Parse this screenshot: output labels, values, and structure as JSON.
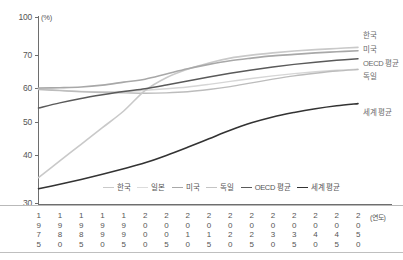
{
  "chart_data": {
    "type": "line",
    "title": "",
    "subtitle": "",
    "xlabel": "(연도)",
    "ylabel": "(%)",
    "unit": "(%)",
    "x": [
      1975,
      1980,
      1985,
      1990,
      1995,
      2000,
      2005,
      2010,
      2015,
      2020,
      2025,
      2030,
      2035,
      2040,
      2045,
      2050
    ],
    "xlim": [
      1975,
      2050
    ],
    "xtick_labels": [
      "1975",
      "1980",
      "1985",
      "1990",
      "1995",
      "2000",
      "2005",
      "2010",
      "2015",
      "2020",
      "2025",
      "2030",
      "2035",
      "2040",
      "2045",
      "2050"
    ],
    "ylim": [
      30,
      100
    ],
    "ytick_labels": [
      "30",
      "40",
      "50",
      "60",
      "70",
      "100"
    ],
    "ytick_values": [
      30,
      40,
      50,
      60,
      70,
      100
    ],
    "axis_break": true,
    "grid": false,
    "legend_position": "bottom-center",
    "series": [
      {
        "name": "한국",
        "color": "#c9c9c9",
        "width": 1.6,
        "end_label": "한국",
        "values": [
          37.0,
          41.5,
          46.0,
          50.5,
          55.0,
          60.5,
          64.0,
          66.3,
          68.0,
          69.3,
          70.1,
          70.7,
          71.2,
          71.6,
          71.9,
          72.2
        ]
      },
      {
        "name": "일본",
        "color": "#d6d6d6",
        "width": 1.4,
        "end_label": "",
        "values": [
          61.0,
          60.6,
          60.3,
          60.2,
          60.3,
          60.6,
          61.0,
          61.5,
          62.2,
          63.0,
          63.8,
          64.5,
          65.1,
          65.6,
          66.0,
          66.3
        ]
      },
      {
        "name": "미국",
        "color": "#a8a8a8",
        "width": 1.6,
        "end_label": "미국",
        "values": [
          61.2,
          61.3,
          61.5,
          62.0,
          62.8,
          63.6,
          65.0,
          66.4,
          67.6,
          68.6,
          69.3,
          69.9,
          70.3,
          70.7,
          71.0,
          71.3
        ]
      },
      {
        "name": "독일",
        "color": "#bcbcbc",
        "width": 1.4,
        "end_label": "독일",
        "values": [
          60.8,
          60.5,
          60.2,
          60.0,
          59.9,
          59.8,
          59.9,
          60.2,
          60.8,
          61.6,
          62.6,
          63.6,
          64.5,
          65.2,
          65.8,
          66.2
        ]
      },
      {
        "name": "OECD 평균",
        "color": "#5a5a5a",
        "width": 1.5,
        "end_label": "OECD 평균",
        "values": [
          55.8,
          57.2,
          58.4,
          59.4,
          60.3,
          61.0,
          62.0,
          63.1,
          64.2,
          65.2,
          66.1,
          66.9,
          67.6,
          68.2,
          68.7,
          69.1
        ]
      },
      {
        "name": "세계 평균",
        "color": "#333333",
        "width": 1.6,
        "end_label": "세계 평균",
        "values": [
          34.0,
          35.2,
          36.5,
          37.9,
          39.4,
          41.0,
          43.0,
          45.2,
          47.5,
          49.8,
          51.8,
          53.4,
          54.6,
          55.6,
          56.4,
          57.0
        ]
      }
    ]
  },
  "legend": {
    "items": [
      {
        "label": "한국",
        "color": "#c9c9c9"
      },
      {
        "label": "일본",
        "color": "#dcdcdc"
      },
      {
        "label": "미국",
        "color": "#a8a8a8"
      },
      {
        "label": "독일",
        "color": "#c4c4c4"
      },
      {
        "label": "OECD 평균",
        "color": "#5a5a5a"
      },
      {
        "label": "세계 평균",
        "color": "#333333"
      }
    ]
  },
  "axes": {
    "y_unit": "(%)",
    "x_unit": "(연도)",
    "y_ticks": [
      "100",
      "70",
      "60",
      "50",
      "40",
      "30"
    ]
  }
}
